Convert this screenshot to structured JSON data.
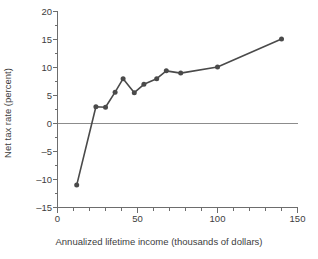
{
  "chart_data": {
    "type": "line",
    "title": "",
    "xlabel": "Annualized lifetime income (thousands of dollars)",
    "ylabel": "Net tax rate (percent)",
    "xlim": [
      0,
      150
    ],
    "ylim": [
      -15,
      20
    ],
    "xticks": [
      0,
      50,
      100,
      150
    ],
    "xtick_labels": [
      "0",
      "50",
      "100",
      "150"
    ],
    "xminor_step": 10,
    "yticks": [
      -15,
      -10,
      -5,
      0,
      5,
      10,
      15,
      20
    ],
    "ytick_labels": [
      "-15",
      "-10",
      "-5",
      "0",
      "5",
      "10",
      "15",
      "20"
    ],
    "yminor_step": 2.5,
    "grid": false,
    "legend": false,
    "zero_line": true,
    "zero_line_color": "#8c8c8c",
    "series": [
      {
        "name": "Net tax rate",
        "color": "#4a4a4a",
        "marker": "circle",
        "x": [
          12,
          24,
          30,
          36,
          41,
          48,
          54,
          62,
          68,
          77,
          100,
          140
        ],
        "y": [
          -11.0,
          3.0,
          2.9,
          5.6,
          8.0,
          5.5,
          7.0,
          8.0,
          9.4,
          9.0,
          10.1,
          15.1
        ]
      }
    ]
  },
  "axis": {
    "y_label_text": "Net tax rate (percent)",
    "x_label_text": "Annualized lifetime income (thousands of dollars)"
  },
  "colors": {
    "line": "#4a4a4a",
    "marker": "#4a4a4a",
    "axis": "#6d6d6d",
    "zero_line": "#8c8c8c",
    "text": "#3d3d3d",
    "background": "#ffffff"
  }
}
